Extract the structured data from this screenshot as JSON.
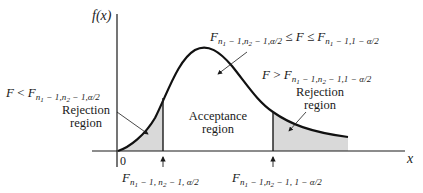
{
  "diagram": {
    "type": "F-distribution two-tailed test regions",
    "y_axis_label": "f(x)",
    "x_axis_label": "x",
    "origin_label": "0",
    "regions": {
      "left_rejection": {
        "label_line1": "Rejection",
        "label_line2": "region",
        "condition": {
          "lhs": "F",
          "op": "<",
          "rhs_main": "F",
          "rhs_sub_prefix": "n",
          "rhs_sub_1": "1",
          "rhs_sub_rest_1": " − 1,",
          "rhs_sub_n2": "n",
          "rhs_sub_2": "2",
          "rhs_sub_rest_2": " − 1,α/2"
        }
      },
      "acceptance": {
        "label_line1": "Acceptance",
        "label_line2": "region",
        "condition": {
          "left_main": "F",
          "left_sub_a": "n",
          "left_sub_a1": "1",
          "left_sub_b": " − 1,",
          "left_sub_c": "n",
          "left_sub_c2": "2",
          "left_sub_d": " − 1,α/2",
          "middle": " ≤ F ≤ ",
          "right_main": "F",
          "right_sub_a": "n",
          "right_sub_a1": "1",
          "right_sub_b": " − 1,1 − α/2"
        }
      },
      "right_rejection": {
        "label_line1": "Rejection",
        "label_line2": "region",
        "condition": {
          "lhs": "F",
          "op": ">",
          "rhs_main": "F",
          "rhs_sub_a": "n",
          "rhs_sub_a1": "1",
          "rhs_sub_b": " − 1,",
          "rhs_sub_c": "n",
          "rhs_sub_c2": "2",
          "rhs_sub_d": " − 1,1 − α/2"
        }
      }
    },
    "critical_values": {
      "lower": {
        "main": "F",
        "sub_a": "n",
        "sub_a1": "1",
        "sub_b": " − 1, ",
        "sub_c": "n",
        "sub_c2": "2",
        "sub_d": " − 1, α/2"
      },
      "upper": {
        "main": "F",
        "sub_a": "n",
        "sub_a1": "1",
        "sub_b": " − 1,",
        "sub_c": "n",
        "sub_c2": "2",
        "sub_d": " − 1, 1 − α/2"
      }
    },
    "colors": {
      "curve": "#111111",
      "shade": "#d9d9d9",
      "axis": "#1a1a1a"
    }
  }
}
